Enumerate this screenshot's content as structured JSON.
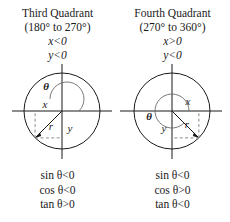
{
  "figure": {
    "background": "#ffffff",
    "ink": "#1a1a1a",
    "dash_color": "#8c8c8c"
  },
  "panels": [
    {
      "id": "third-quadrant",
      "title": "Third Quadrant",
      "range": "(180° to 270°)",
      "cond_x": "x<0",
      "cond_y": "y<0",
      "labels": {
        "theta": "θ",
        "x": "x",
        "y": "y",
        "r": "r"
      },
      "signs": [
        {
          "fn": "sin",
          "theta": "θ",
          "rel": "<0",
          "text": "sin θ<0"
        },
        {
          "fn": "cos",
          "theta": "θ",
          "rel": "<0",
          "text": "cos θ<0"
        },
        {
          "fn": "tan",
          "theta": "θ",
          "rel": ">0",
          "text": "tan θ>0"
        }
      ],
      "geometry": {
        "center_x": 62,
        "center_y": 49,
        "radius": 38,
        "arc_radius": 17,
        "angle_deg": 225,
        "point_x": -26.9,
        "point_y": 26.9
      }
    },
    {
      "id": "fourth-quadrant",
      "title": "Fourth Quadrant",
      "range": "(270° to 360°)",
      "cond_x": "x>0",
      "cond_y": "y<0",
      "labels": {
        "theta": "θ",
        "x": "x",
        "y": "y",
        "r": "r"
      },
      "signs": [
        {
          "fn": "sin",
          "theta": "θ",
          "rel": "<0",
          "text": "sin θ<0"
        },
        {
          "fn": "cos",
          "theta": "θ",
          "rel": ">0",
          "text": "cos θ>0"
        },
        {
          "fn": "tan",
          "theta": "θ",
          "rel": "<0",
          "text": "tan θ<0"
        }
      ],
      "geometry": {
        "center_x": 57,
        "center_y": 49,
        "radius": 38,
        "arc_radius": 17,
        "angle_deg": 315,
        "point_x": 26.9,
        "point_y": 26.9
      }
    }
  ]
}
